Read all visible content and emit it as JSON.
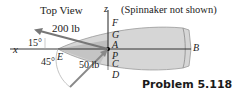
{
  "figure": {
    "view_title": "Top View",
    "note": "(Spinnaker not shown)",
    "caption": "Problem 5.118",
    "forces": [
      {
        "label": "200 lb",
        "angle_label": "15°"
      },
      {
        "label": "50 lb",
        "angle_label": "45°"
      }
    ],
    "axes": {
      "x": "x",
      "z": "z"
    },
    "points": {
      "A": "A",
      "B": "B",
      "C": "C",
      "D": "D",
      "E": "E",
      "F": "F",
      "G": "G",
      "P": "P"
    },
    "colors": {
      "hull_fill": "#d4d4d4",
      "hull_dark": "#b8b8b8",
      "arrow": "#7a7a7a",
      "line": "#222222"
    }
  }
}
